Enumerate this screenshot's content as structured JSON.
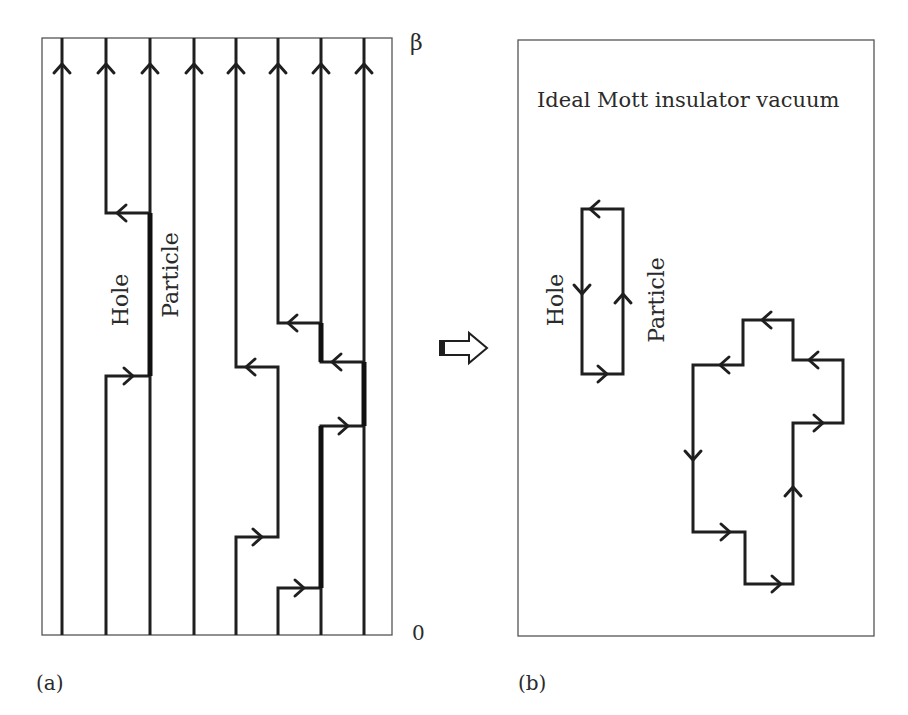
{
  "figure": {
    "panel_a": {
      "label": "(a)",
      "axis_top_label": "β",
      "axis_bottom_label": "0",
      "hole_label": "Hole",
      "particle_label": "Particle",
      "worldline_count": 8
    },
    "transition_arrow": "hollow-right-arrow",
    "panel_b": {
      "label": "(b)",
      "title": "Ideal Mott insulator vacuum",
      "hole_label": "Hole",
      "particle_label": "Particle"
    },
    "colors": {
      "line": "#1f1f1f",
      "frame": "#555555",
      "text": "#2a2a2a",
      "background": "#ffffff"
    }
  }
}
